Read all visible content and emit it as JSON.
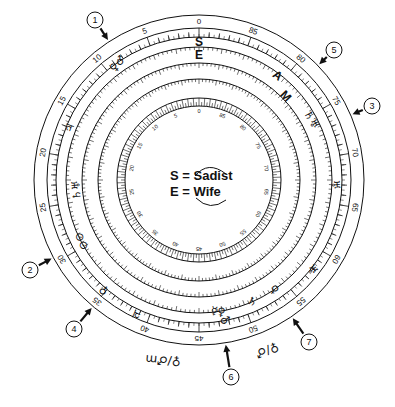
{
  "diagram": {
    "center": [
      199,
      180
    ],
    "outer_radius": 165,
    "stroke_color": "#111111",
    "background": "#ffffff"
  },
  "legend": {
    "rows": [
      {
        "key": "S",
        "eq": "=",
        "value": "Sadist"
      },
      {
        "key": "E",
        "eq": "=",
        "value": "Wife"
      }
    ]
  },
  "outer_scale": {
    "labels": [
      "0",
      "5",
      "10",
      "15",
      "20",
      "25",
      "30",
      "35",
      "40",
      "45",
      "50",
      "55",
      "60",
      "65",
      "70",
      "75",
      "80",
      "85"
    ],
    "step_degrees": 20
  },
  "inner_dial": {
    "labels": [
      "0",
      "5",
      "10",
      "15",
      "20",
      "25",
      "30",
      "35",
      "40",
      "45",
      "50",
      "55",
      "60",
      "65",
      "70",
      "75",
      "80",
      "85"
    ]
  },
  "ring_letters": {
    "S": "S",
    "E": "E",
    "A": "A",
    "M": "M"
  },
  "callouts": [
    {
      "n": "1",
      "x": 95,
      "y": 20
    },
    {
      "n": "2",
      "x": 30,
      "y": 270
    },
    {
      "n": "3",
      "x": 372,
      "y": 106
    },
    {
      "n": "4",
      "x": 74,
      "y": 329
    },
    {
      "n": "5",
      "x": 334,
      "y": 50
    },
    {
      "n": "6",
      "x": 231,
      "y": 377
    },
    {
      "n": "7",
      "x": 309,
      "y": 342
    }
  ],
  "planet_glyphs": [
    {
      "symbol": "♀♂",
      "x": 118,
      "y": 64,
      "rot": -50
    },
    {
      "symbol": "♃",
      "x": 70,
      "y": 128,
      "rot": -70
    },
    {
      "symbol": "♄♅",
      "x": 77,
      "y": 190,
      "rot": -95
    },
    {
      "symbol": "⊙⊙",
      "x": 82,
      "y": 241,
      "rot": -115
    },
    {
      "symbol": "♀",
      "x": 104,
      "y": 290,
      "rot": -140
    },
    {
      "symbol": "♃",
      "x": 137,
      "y": 314,
      "rot": -155
    },
    {
      "symbol": "☿♀",
      "x": 218,
      "y": 312,
      "rot": 10
    },
    {
      "symbol": "♂",
      "x": 225,
      "y": 321,
      "rot": 10
    },
    {
      "symbol": "♄",
      "x": 252,
      "y": 302,
      "rot": 25
    },
    {
      "symbol": "♀",
      "x": 274,
      "y": 290,
      "rot": 35
    },
    {
      "symbol": "♅",
      "x": 312,
      "y": 270,
      "rot": 50
    },
    {
      "symbol": "♄♅",
      "x": 311,
      "y": 120,
      "rot": 60
    },
    {
      "symbol": "♅",
      "x": 335,
      "y": 185,
      "rot": 85
    }
  ],
  "outside_glyphs": [
    {
      "symbol": "♀/♂m",
      "x": 163,
      "y": 360,
      "rot": 185
    },
    {
      "symbol": "♀/♂",
      "x": 267,
      "y": 350,
      "rot": 160
    }
  ]
}
